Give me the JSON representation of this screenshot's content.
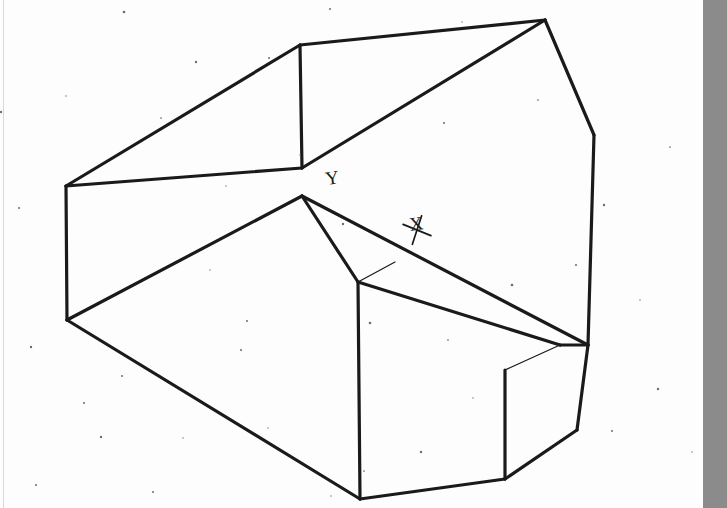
{
  "document": {
    "title": "Isometric engineering sketch of a notched polyhedral block",
    "medium": "scanned line drawing",
    "background_color": "#fdfdfd",
    "ink_color": "#1a1a1a",
    "line_weight_px": 3.2
  },
  "annotations": [
    {
      "name": "axis-label-y",
      "text": "Y",
      "x": 333,
      "y": 184,
      "rotation": -8
    },
    {
      "name": "axis-label-x",
      "text": "X",
      "x": 417,
      "y": 230,
      "rotation": -8
    }
  ],
  "canvas": {
    "width": 727,
    "height": 508
  },
  "gray_edge_bar": {
    "name": "scan-edge-shadow",
    "left": 703,
    "width": 24,
    "color": "#8b8b8b"
  },
  "faint_rule": {
    "name": "page-margin-rule",
    "left": 3,
    "color": "#d8d8d8"
  },
  "chart_data": {
    "type": "line",
    "xlabel": "X",
    "ylabel": "Y",
    "grid": false,
    "legend": null,
    "vertices": {
      "left_upper": [
        66,
        186
      ],
      "left_lower": [
        67,
        320
      ],
      "ridge_left": [
        300,
        45
      ],
      "ridge_right": [
        545,
        20
      ],
      "center_hub": [
        302,
        168
      ],
      "center_low": [
        302,
        196
      ],
      "right_bend": [
        594,
        135
      ],
      "right_mid": [
        588,
        345
      ],
      "right_low_bend": [
        577,
        430
      ],
      "bottom_left": [
        360,
        499
      ],
      "bottom_mid": [
        505,
        479
      ],
      "notch_top": [
        358,
        282
      ],
      "notch_hub": [
        560,
        345
      ],
      "notch_bottom": [
        505,
        479
      ],
      "inner_corner": [
        505,
        370
      ]
    },
    "edges": [
      {
        "name": "top-left-chamfer",
        "points": [
          [
            66,
            186
          ],
          [
            300,
            45
          ]
        ]
      },
      {
        "name": "ridge",
        "points": [
          [
            300,
            45
          ],
          [
            545,
            20
          ]
        ]
      },
      {
        "name": "upper-face-diagonal",
        "points": [
          [
            302,
            168
          ],
          [
            545,
            20
          ]
        ]
      },
      {
        "name": "ridge-vertical",
        "points": [
          [
            300,
            45
          ],
          [
            302,
            168
          ]
        ]
      },
      {
        "name": "left-upper-horizontal",
        "points": [
          [
            66,
            186
          ],
          [
            302,
            168
          ]
        ]
      },
      {
        "name": "left-vertical",
        "points": [
          [
            66,
            186
          ],
          [
            67,
            320
          ]
        ]
      },
      {
        "name": "left-lower-diagonal",
        "points": [
          [
            67,
            320
          ],
          [
            302,
            196
          ]
        ]
      },
      {
        "name": "bottom-left-long-diagonal",
        "points": [
          [
            67,
            320
          ],
          [
            360,
            499
          ]
        ]
      },
      {
        "name": "bottom-edge",
        "points": [
          [
            360,
            499
          ],
          [
            505,
            479
          ]
        ]
      },
      {
        "name": "hub-to-notch",
        "points": [
          [
            302,
            196
          ],
          [
            358,
            282
          ]
        ]
      },
      {
        "name": "notch-left-vertical",
        "points": [
          [
            358,
            282
          ],
          [
            360,
            499
          ]
        ]
      },
      {
        "name": "notch-diagonal-upper",
        "points": [
          [
            358,
            282
          ],
          [
            560,
            345
          ]
        ]
      },
      {
        "name": "notch-inner-diagonal",
        "points": [
          [
            302,
            196
          ],
          [
            588,
            345
          ]
        ]
      },
      {
        "name": "notch-inner-vertical",
        "points": [
          [
            505,
            370
          ],
          [
            505,
            479
          ]
        ]
      },
      {
        "name": "notch-inner-to-hub",
        "points": [
          [
            505,
            370
          ],
          [
            560,
            345
          ]
        ]
      },
      {
        "name": "right-ridge-descend",
        "points": [
          [
            545,
            20
          ],
          [
            594,
            135
          ]
        ]
      },
      {
        "name": "right-side-long",
        "points": [
          [
            594,
            135
          ],
          [
            588,
            345
          ]
        ]
      },
      {
        "name": "right-lower-taper",
        "points": [
          [
            588,
            345
          ],
          [
            577,
            430
          ]
        ]
      },
      {
        "name": "right-bottom-chamfer",
        "points": [
          [
            577,
            430
          ],
          [
            505,
            479
          ]
        ]
      },
      {
        "name": "hub-to-right-mid",
        "points": [
          [
            560,
            345
          ],
          [
            588,
            345
          ]
        ]
      },
      {
        "name": "notch-thin-connector",
        "points": [
          [
            358,
            282
          ],
          [
            395,
            262
          ]
        ]
      }
    ]
  },
  "speckles": [
    [
      124,
      12
    ],
    [
      330,
      9
    ],
    [
      462,
      22
    ],
    [
      196,
      62
    ],
    [
      66,
      96
    ],
    [
      444,
      123
    ],
    [
      19,
      208
    ],
    [
      210,
      270
    ],
    [
      343,
      224
    ],
    [
      1,
      112
    ],
    [
      183,
      438
    ],
    [
      241,
      350
    ],
    [
      370,
      323
    ],
    [
      300,
      155
    ],
    [
      538,
      100
    ],
    [
      604,
      205
    ],
    [
      640,
      300
    ],
    [
      612,
      431
    ],
    [
      658,
      389
    ],
    [
      31,
      347
    ],
    [
      36,
      485
    ],
    [
      122,
      376
    ],
    [
      153,
      492
    ],
    [
      268,
      428
    ],
    [
      364,
      471
    ],
    [
      473,
      398
    ],
    [
      269,
      58
    ],
    [
      722,
      32
    ],
    [
      512,
      285
    ],
    [
      448,
      340
    ],
    [
      331,
      496
    ],
    [
      101,
      437
    ],
    [
      247,
      321
    ],
    [
      84,
      403
    ],
    [
      421,
      452
    ],
    [
      576,
      265
    ],
    [
      670,
      147
    ],
    [
      692,
      452
    ],
    [
      226,
      186
    ],
    [
      161,
      118
    ]
  ]
}
